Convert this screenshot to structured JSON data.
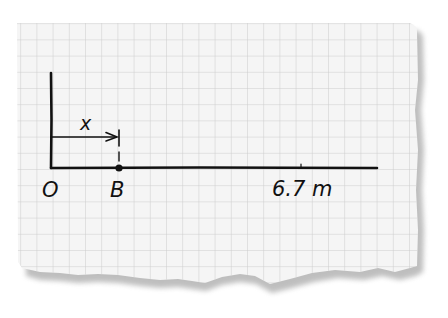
{
  "diagram": {
    "type": "number-line",
    "background": "graph-paper",
    "colors": {
      "paper": "#f4f4f4",
      "grid": "#cfcfcf",
      "ink": "#111111",
      "shadow": "#9a9a9a"
    },
    "labels": {
      "origin": "O",
      "point": "B",
      "distance": "x",
      "end": "6.7 m"
    },
    "origin_value": 0,
    "end_value_m": 6.7
  }
}
